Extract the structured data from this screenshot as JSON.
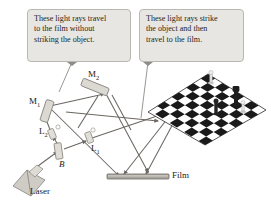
{
  "figure": {
    "background_color": "#ffffff",
    "ray_color": "#6e6a66",
    "callout_fill": "#e8e6e2",
    "callout_border": "#b9b7b2",
    "optics_fill": "#d5d2cc",
    "optics_stroke": "#8a8680",
    "board_dark": "#1a1a1a",
    "board_light": "#ffffff"
  },
  "callouts": [
    {
      "id": "callout-left",
      "lines": [
        "These light rays travel",
        "to the film without",
        "striking the object."
      ]
    },
    {
      "id": "callout-right",
      "lines": [
        "These light rays strike",
        "the object and then",
        "travel to the film."
      ]
    }
  ],
  "labels": {
    "mirror_2": "M",
    "mirror_2_sub": "2",
    "mirror_1": "M",
    "mirror_1_sub": "1",
    "lens_2": "L",
    "lens_2_sub": "2",
    "lens_1": "L",
    "lens_1_sub": "1",
    "beam_splitter": "B",
    "laser": "Laser",
    "film": "Film"
  },
  "components": [
    {
      "name": "laser",
      "label": "Laser"
    },
    {
      "name": "beam-splitter",
      "label": "B"
    },
    {
      "name": "lens-1",
      "label": "L1"
    },
    {
      "name": "lens-2",
      "label": "L2"
    },
    {
      "name": "mirror-1",
      "label": "M1"
    },
    {
      "name": "mirror-2",
      "label": "M2"
    },
    {
      "name": "object-chessboard",
      "label": ""
    },
    {
      "name": "film-plate",
      "label": "Film"
    }
  ]
}
